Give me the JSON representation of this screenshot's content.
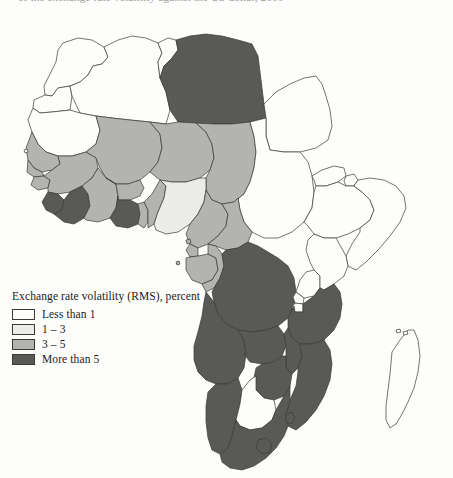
{
  "page": {
    "cut_off_caption": "of the exchange rate volatility against the US dollar, 2000",
    "background_color": "#fdfdfc"
  },
  "legend": {
    "title": "Exchange rate volatility (RMS), percent",
    "items": [
      {
        "label": "Less than 1",
        "color": "#fdfdfb"
      },
      {
        "label": "1 – 3",
        "color": "#ebebe8"
      },
      {
        "label": "3 – 5",
        "color": "#b3b3b0"
      },
      {
        "label": "More than 5",
        "color": "#595957"
      }
    ]
  },
  "map": {
    "name": "africa-choropleth",
    "border_color": "#3a3a38",
    "regions": [
      {
        "name": "morocco",
        "category": "Less than 1",
        "color": "#fdfdfb"
      },
      {
        "name": "western-sahara",
        "category": "Less than 1",
        "color": "#fdfdfb"
      },
      {
        "name": "algeria",
        "category": "Less than 1",
        "color": "#fdfdfb"
      },
      {
        "name": "tunisia",
        "category": "Less than 1",
        "color": "#fdfdfb"
      },
      {
        "name": "libya",
        "category": "More than 5",
        "color": "#595957"
      },
      {
        "name": "egypt",
        "category": "Less than 1",
        "color": "#fdfdfb"
      },
      {
        "name": "mauritania",
        "category": "Less than 1",
        "color": "#fdfdfb"
      },
      {
        "name": "mali",
        "category": "3 – 5",
        "color": "#b3b3b0"
      },
      {
        "name": "niger",
        "category": "3 – 5",
        "color": "#b3b3b0"
      },
      {
        "name": "chad",
        "category": "3 – 5",
        "color": "#b3b3b0"
      },
      {
        "name": "sudan",
        "category": "Less than 1",
        "color": "#fdfdfb"
      },
      {
        "name": "senegal",
        "category": "3 – 5",
        "color": "#b3b3b0"
      },
      {
        "name": "gambia",
        "category": "3 – 5",
        "color": "#b3b3b0"
      },
      {
        "name": "guinea-bissau",
        "category": "3 – 5",
        "color": "#b3b3b0"
      },
      {
        "name": "guinea",
        "category": "3 – 5",
        "color": "#b3b3b0"
      },
      {
        "name": "sierra-leone",
        "category": "More than 5",
        "color": "#595957"
      },
      {
        "name": "liberia",
        "category": "More than 5",
        "color": "#595957"
      },
      {
        "name": "cote-divoire",
        "category": "3 – 5",
        "color": "#b3b3b0"
      },
      {
        "name": "burkina-faso",
        "category": "3 – 5",
        "color": "#b3b3b0"
      },
      {
        "name": "ghana",
        "category": "More than 5",
        "color": "#595957"
      },
      {
        "name": "togo",
        "category": "3 – 5",
        "color": "#b3b3b0"
      },
      {
        "name": "benin",
        "category": "3 – 5",
        "color": "#b3b3b0"
      },
      {
        "name": "nigeria",
        "category": "1 – 3",
        "color": "#ebebe8"
      },
      {
        "name": "cameroon",
        "category": "3 – 5",
        "color": "#b3b3b0"
      },
      {
        "name": "central-african-republic",
        "category": "3 – 5",
        "color": "#b3b3b0"
      },
      {
        "name": "equatorial-guinea",
        "category": "3 – 5",
        "color": "#b3b3b0"
      },
      {
        "name": "gabon",
        "category": "3 – 5",
        "color": "#b3b3b0"
      },
      {
        "name": "congo",
        "category": "3 – 5",
        "color": "#b3b3b0"
      },
      {
        "name": "democratic-republic-congo",
        "category": "More than 5",
        "color": "#595957"
      },
      {
        "name": "eritrea",
        "category": "Less than 1",
        "color": "#fdfdfb"
      },
      {
        "name": "djibouti",
        "category": "Less than 1",
        "color": "#fdfdfb"
      },
      {
        "name": "ethiopia",
        "category": "Less than 1",
        "color": "#fdfdfb"
      },
      {
        "name": "somalia",
        "category": "Less than 1",
        "color": "#fdfdfb"
      },
      {
        "name": "uganda",
        "category": "Less than 1",
        "color": "#fdfdfb"
      },
      {
        "name": "kenya",
        "category": "Less than 1",
        "color": "#fdfdfb"
      },
      {
        "name": "rwanda",
        "category": "Less than 1",
        "color": "#fdfdfb"
      },
      {
        "name": "burundi",
        "category": "Less than 1",
        "color": "#fdfdfb"
      },
      {
        "name": "tanzania",
        "category": "More than 5",
        "color": "#595957"
      },
      {
        "name": "angola",
        "category": "More than 5",
        "color": "#595957"
      },
      {
        "name": "zambia",
        "category": "More than 5",
        "color": "#595957"
      },
      {
        "name": "malawi",
        "category": "More than 5",
        "color": "#595957"
      },
      {
        "name": "mozambique",
        "category": "More than 5",
        "color": "#595957"
      },
      {
        "name": "zimbabwe",
        "category": "More than 5",
        "color": "#595957"
      },
      {
        "name": "namibia",
        "category": "More than 5",
        "color": "#595957"
      },
      {
        "name": "botswana",
        "category": "Less than 1",
        "color": "#fdfdfb"
      },
      {
        "name": "south-africa",
        "category": "More than 5",
        "color": "#595957"
      },
      {
        "name": "lesotho",
        "category": "More than 5",
        "color": "#595957"
      },
      {
        "name": "swaziland",
        "category": "More than 5",
        "color": "#595957"
      },
      {
        "name": "madagascar",
        "category": "Less than 1",
        "color": "#fdfdfb"
      },
      {
        "name": "comoros",
        "category": "Less than 1",
        "color": "#fdfdfb"
      }
    ]
  }
}
